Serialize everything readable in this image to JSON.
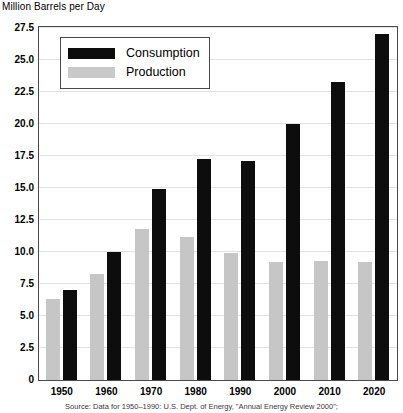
{
  "chart_data": {
    "type": "bar",
    "title": "",
    "ylabel": "Million Barrels per Day",
    "xlabel": "",
    "categories": [
      "1950",
      "1960",
      "1970",
      "1980",
      "1990",
      "2000",
      "2010",
      "2020"
    ],
    "series": [
      {
        "name": "Consumption",
        "color": "#0d0d0d",
        "values": [
          7.0,
          10.0,
          14.9,
          17.3,
          17.1,
          20.0,
          23.3,
          27.0
        ]
      },
      {
        "name": "Production",
        "color": "#c6c6c6",
        "values": [
          6.3,
          8.3,
          11.8,
          11.2,
          9.9,
          9.2,
          9.3,
          9.2
        ]
      }
    ],
    "ylim": [
      0,
      27.5
    ],
    "yticks": [
      "0",
      "2.5",
      "5.0",
      "7.5",
      "10.0",
      "12.5",
      "15.0",
      "17.5",
      "20.0",
      "22.5",
      "25.0",
      "27.5"
    ],
    "ytick_values": [
      0,
      2.5,
      5.0,
      7.5,
      10.0,
      12.5,
      15.0,
      17.5,
      20.0,
      22.5,
      25.0,
      27.5
    ],
    "grid": true,
    "legend_position": "top-left"
  },
  "legend": {
    "items": [
      {
        "label": "Consumption",
        "swatch": "consumption"
      },
      {
        "label": "Production",
        "swatch": "production"
      }
    ]
  },
  "footer": {
    "source": "Source: Data for 1950–1990: U.S. Dept. of Energy, \"Annual Energy Review 2000\";"
  }
}
